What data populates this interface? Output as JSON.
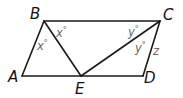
{
  "diagram": {
    "type": "geometry",
    "colors": {
      "line": "#1a1a1a",
      "vertex_label": "#111111",
      "angle_label": "#6a6a6a"
    },
    "vertices": {
      "A": {
        "label": "A"
      },
      "B": {
        "label": "B"
      },
      "C": {
        "label": "C"
      },
      "D": {
        "label": "D"
      },
      "E": {
        "label": "E"
      }
    },
    "segments": [
      "AB",
      "BC",
      "CD",
      "DA",
      "BE",
      "CE"
    ],
    "angle_labels": [
      {
        "id": "abe",
        "var": "x",
        "deg": "°"
      },
      {
        "id": "ebc",
        "var": "x",
        "deg": "°"
      },
      {
        "id": "bce",
        "var": "y",
        "deg": "°"
      },
      {
        "id": "ecd",
        "var": "y",
        "deg": "°"
      }
    ],
    "side_label": {
      "segment": "CD",
      "text": "z"
    }
  }
}
